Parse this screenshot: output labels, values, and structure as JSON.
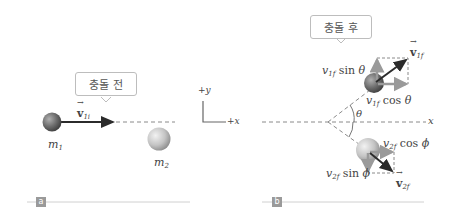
{
  "panel_a": {
    "callout": "충돌 전",
    "velocity_label": "v",
    "velocity_sub": "1i",
    "mass1_label": "m",
    "mass1_sub": "1",
    "mass2_label": "m",
    "mass2_sub": "2",
    "tag": "a"
  },
  "axes": {
    "y_label": "+y",
    "x_label": "+x"
  },
  "panel_b": {
    "callout": "충돌 후",
    "x_axis_label": "x",
    "theta_label": "θ",
    "v1f_label": "v",
    "v1f_sub": "1f",
    "v1f_sin": {
      "v": "v",
      "sub": "1f",
      "fn": "sin",
      "angle": "θ"
    },
    "v1f_cos": {
      "v": "v",
      "sub": "1f",
      "fn": "cos",
      "angle": "θ"
    },
    "v2f_label": "v",
    "v2f_sub": "2f",
    "v2f_cos": {
      "v": "v",
      "sub": "2f",
      "fn": "cos",
      "angle": "ϕ"
    },
    "v2f_sin": {
      "v": "v",
      "sub": "2f",
      "fn": "sin",
      "angle": "ϕ"
    },
    "tag": "b"
  },
  "colors": {
    "ball1": "#7a7a7a",
    "ball2": "#c8c8c8",
    "arrow_dark": "#2b2b2b",
    "arrow_light": "#9a9a9a",
    "dash": "#8a8a8a",
    "rule": "#d0d0d0",
    "tag": "#9a9a9a"
  }
}
